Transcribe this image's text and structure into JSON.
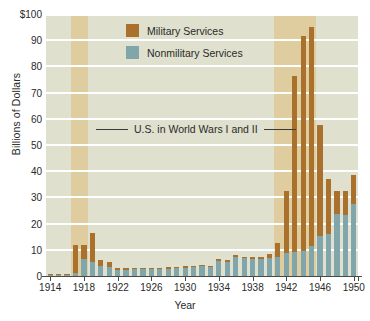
{
  "chart_data": {
    "type": "bar",
    "stacked": true,
    "title": "",
    "xlabel": "Year",
    "ylabel": "Billions of Dollars",
    "ylim": [
      0,
      100
    ],
    "ytick_labels": [
      "$100",
      "90",
      "80",
      "70",
      "60",
      "50",
      "40",
      "30",
      "20",
      "10",
      "0"
    ],
    "ytick_values": [
      100,
      90,
      80,
      70,
      60,
      50,
      40,
      30,
      20,
      10,
      0
    ],
    "xtick_labels": [
      "1914",
      "1918",
      "1922",
      "1926",
      "1930",
      "1934",
      "1938",
      "1942",
      "1946",
      "1950"
    ],
    "grid": "horizontal-white",
    "legend_position": "inside-top-left",
    "categories": [
      1914,
      1915,
      1916,
      1917,
      1918,
      1919,
      1920,
      1921,
      1922,
      1923,
      1924,
      1925,
      1926,
      1927,
      1928,
      1929,
      1930,
      1931,
      1932,
      1933,
      1934,
      1935,
      1936,
      1937,
      1938,
      1939,
      1940,
      1941,
      1942,
      1943,
      1944,
      1945,
      1946,
      1947,
      1948,
      1949,
      1950
    ],
    "series": [
      {
        "name": "Nonmilitary Services",
        "color": "#80a5ab",
        "values": [
          0.5,
          0.5,
          0.5,
          1.0,
          6.5,
          5.2,
          4.0,
          3.3,
          2.3,
          2.4,
          2.5,
          2.6,
          2.5,
          2.7,
          2.8,
          2.9,
          3.1,
          3.3,
          3.7,
          3.6,
          5.9,
          5.4,
          7.4,
          6.7,
          6.6,
          6.5,
          7.0,
          7.3,
          8.6,
          9.3,
          9.6,
          11.5,
          15.3,
          15.9,
          23.7,
          23.3,
          27.6
        ]
      },
      {
        "name": "Military Services",
        "color": "#a9712c",
        "values": [
          0.2,
          0.3,
          0.4,
          10.8,
          5.3,
          11.3,
          2.0,
          1.9,
          0.6,
          0.5,
          0.5,
          0.5,
          0.5,
          0.5,
          0.5,
          0.5,
          0.6,
          0.5,
          0.4,
          0.4,
          0.5,
          0.7,
          0.7,
          0.7,
          0.8,
          0.9,
          1.5,
          5.3,
          24.0,
          66.9,
          81.9,
          83.5,
          42.5,
          21.3,
          8.6,
          9.0,
          10.8
        ]
      }
    ],
    "totals": [
      0.7,
      0.8,
      0.9,
      11.8,
      11.8,
      16.5,
      6.0,
      5.2,
      2.9,
      2.9,
      3.0,
      3.1,
      3.0,
      3.2,
      3.3,
      3.4,
      3.7,
      3.8,
      4.1,
      4.0,
      6.4,
      6.1,
      8.1,
      7.4,
      7.4,
      7.4,
      8.5,
      12.6,
      32.6,
      76.2,
      91.5,
      95.0,
      57.8,
      37.2,
      32.3,
      32.3,
      38.4
    ],
    "shaded_bands": [
      {
        "label": "World War I",
        "start": 1917,
        "end": 1918,
        "color": "#dfcda0"
      },
      {
        "label": "World War II",
        "start": 1941,
        "end": 1945,
        "color": "#dfcda0"
      }
    ],
    "annotations": [
      {
        "name": "war-annotation",
        "text": "U.S. in World Wars I and II"
      }
    ],
    "colors": {
      "plot_background": "#dfe0ce",
      "band": "#dfcda0",
      "gridline": "#ffffff",
      "axis": "#4a4a44",
      "text": "#2a2a28",
      "military": "#a9712c",
      "nonmilitary": "#80a5ab"
    }
  },
  "legend": {
    "items": [
      {
        "label": "Military Services",
        "color": "#a9712c"
      },
      {
        "label": "Nonmilitary Services",
        "color": "#80a5ab"
      }
    ]
  },
  "axes": {
    "y_title": "Billions of Dollars",
    "x_title": "Year"
  },
  "annotation": {
    "war_text": "U.S. in World Wars I and II"
  }
}
